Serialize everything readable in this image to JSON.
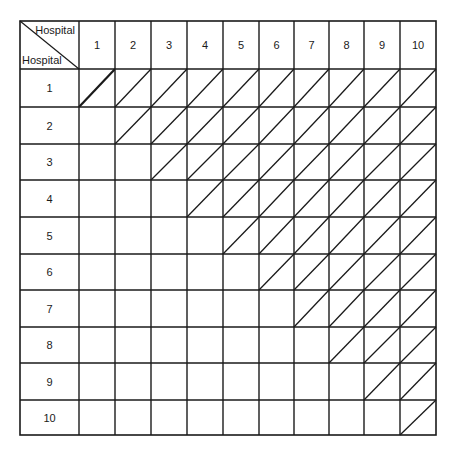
{
  "matrix": {
    "corner": {
      "top_right_label": "Hospital",
      "bottom_left_label": "Hospital"
    },
    "column_headers": [
      "1",
      "2",
      "3",
      "4",
      "5",
      "6",
      "7",
      "8",
      "9",
      "10"
    ],
    "row_headers": [
      "1",
      "2",
      "3",
      "4",
      "5",
      "6",
      "7",
      "8",
      "9",
      "10"
    ],
    "cell_rule": "diagonal slash drawn in cells where column >= row (upper triangle including main diagonal)",
    "line_color": "#1a1a1a",
    "background": "#ffffff"
  }
}
